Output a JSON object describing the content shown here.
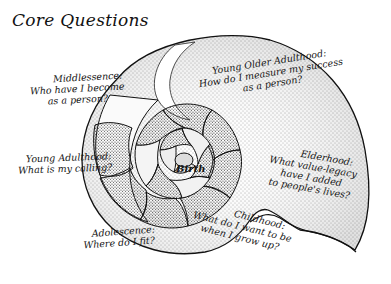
{
  "title": "Core Questions",
  "center_label": "Birth",
  "stages": [
    {
      "id": "middlessence",
      "stage": "Middlessence:",
      "question_lines": [
        "Who have I become",
        "as a person?"
      ]
    },
    {
      "id": "young-older-adulthood",
      "stage": "Young Older Adulthood:",
      "question_lines": [
        "How do I measure my success",
        "as a person?"
      ]
    },
    {
      "id": "young-adulthood",
      "stage": "Young Adulthood:",
      "question_lines": [
        "What is my calling?"
      ]
    },
    {
      "id": "elderhood",
      "stage": "Elderhood:",
      "question_lines": [
        "What value-legacy",
        "have I added",
        "to people's lives?"
      ]
    },
    {
      "id": "adolescence",
      "stage": "Adolescence:",
      "question_lines": [
        "Where do I fit?"
      ]
    },
    {
      "id": "childhood",
      "stage": "Childhood:",
      "question_lines": [
        "What do I want to be",
        "when I grow up?"
      ]
    }
  ],
  "colors": {
    "ink": "#151515",
    "background": "#ffffff",
    "stipple": "#3a3a3a"
  }
}
